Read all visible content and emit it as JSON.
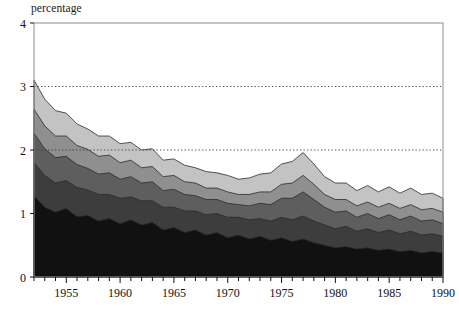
{
  "chart": {
    "type": "area",
    "ylabel_text": "percentage",
    "axis": {
      "y_ticks": [
        "0",
        "1",
        "2",
        "3",
        "4"
      ],
      "x_ticks": [
        "1955",
        "1960",
        "1965",
        "1970",
        "1975",
        "1980",
        "1985",
        "1990"
      ]
    }
  },
  "chart_data": {
    "type": "area",
    "stacked": true,
    "title": "",
    "xlabel": "",
    "ylabel": "percentage",
    "xlim": [
      1952,
      1990
    ],
    "ylim": [
      0,
      4
    ],
    "y_ticks": [
      0,
      1,
      2,
      3,
      4
    ],
    "x_ticks": [
      1955,
      1960,
      1965,
      1970,
      1975,
      1980,
      1985,
      1990
    ],
    "x_minor_tick_step": 1,
    "gridlines": {
      "y": [
        2,
        3
      ],
      "style": "dotted"
    },
    "legend": "none",
    "colors": [
      "#111111",
      "#3d3d3d",
      "#5e5e5e",
      "#8f8f8f",
      "#c3c3c3"
    ],
    "x": [
      1952,
      1953,
      1954,
      1955,
      1956,
      1957,
      1958,
      1959,
      1960,
      1961,
      1962,
      1963,
      1964,
      1965,
      1966,
      1967,
      1968,
      1969,
      1970,
      1971,
      1972,
      1973,
      1974,
      1975,
      1976,
      1977,
      1978,
      1979,
      1980,
      1981,
      1982,
      1983,
      1984,
      1985,
      1986,
      1987,
      1988,
      1989,
      1990
    ],
    "series": [
      {
        "name": "band-1-darkest",
        "values": [
          1.28,
          1.1,
          1.02,
          1.08,
          0.95,
          0.97,
          0.88,
          0.92,
          0.84,
          0.9,
          0.82,
          0.86,
          0.74,
          0.78,
          0.7,
          0.74,
          0.66,
          0.7,
          0.62,
          0.66,
          0.6,
          0.64,
          0.58,
          0.62,
          0.56,
          0.6,
          0.54,
          0.5,
          0.46,
          0.48,
          0.44,
          0.46,
          0.42,
          0.44,
          0.4,
          0.42,
          0.38,
          0.4,
          0.38
        ]
      },
      {
        "name": "band-2-dark",
        "values": [
          0.52,
          0.5,
          0.46,
          0.44,
          0.46,
          0.4,
          0.42,
          0.38,
          0.4,
          0.36,
          0.38,
          0.34,
          0.36,
          0.32,
          0.34,
          0.3,
          0.32,
          0.3,
          0.32,
          0.28,
          0.3,
          0.28,
          0.3,
          0.32,
          0.34,
          0.36,
          0.34,
          0.32,
          0.3,
          0.32,
          0.28,
          0.3,
          0.28,
          0.3,
          0.28,
          0.3,
          0.28,
          0.28,
          0.26
        ]
      },
      {
        "name": "band-3-mid",
        "values": [
          0.46,
          0.42,
          0.4,
          0.38,
          0.36,
          0.34,
          0.32,
          0.34,
          0.3,
          0.32,
          0.28,
          0.3,
          0.26,
          0.28,
          0.26,
          0.24,
          0.24,
          0.22,
          0.22,
          0.2,
          0.22,
          0.24,
          0.26,
          0.3,
          0.34,
          0.38,
          0.34,
          0.28,
          0.26,
          0.24,
          0.22,
          0.24,
          0.22,
          0.24,
          0.22,
          0.24,
          0.22,
          0.22,
          0.2
        ]
      },
      {
        "name": "band-4-light",
        "values": [
          0.38,
          0.36,
          0.34,
          0.32,
          0.3,
          0.3,
          0.28,
          0.28,
          0.26,
          0.26,
          0.24,
          0.24,
          0.22,
          0.22,
          0.2,
          0.2,
          0.18,
          0.18,
          0.18,
          0.16,
          0.18,
          0.18,
          0.2,
          0.22,
          0.24,
          0.26,
          0.24,
          0.2,
          0.2,
          0.18,
          0.18,
          0.18,
          0.18,
          0.18,
          0.18,
          0.18,
          0.18,
          0.18,
          0.18
        ]
      },
      {
        "name": "band-5-lightest",
        "values": [
          0.46,
          0.42,
          0.4,
          0.36,
          0.34,
          0.32,
          0.32,
          0.3,
          0.3,
          0.28,
          0.28,
          0.28,
          0.26,
          0.26,
          0.26,
          0.24,
          0.26,
          0.24,
          0.26,
          0.24,
          0.26,
          0.28,
          0.3,
          0.32,
          0.34,
          0.36,
          0.32,
          0.28,
          0.26,
          0.26,
          0.24,
          0.26,
          0.24,
          0.26,
          0.24,
          0.26,
          0.24,
          0.24,
          0.22
        ]
      }
    ],
    "totals": [
      3.1,
      2.8,
      2.62,
      2.58,
      2.41,
      2.33,
      2.22,
      2.22,
      2.1,
      2.12,
      2.0,
      2.02,
      1.84,
      1.86,
      1.76,
      1.72,
      1.66,
      1.64,
      1.6,
      1.54,
      1.56,
      1.62,
      1.64,
      1.78,
      1.82,
      1.96,
      1.78,
      1.58,
      1.48,
      1.48,
      1.36,
      1.44,
      1.34,
      1.42,
      1.32,
      1.4,
      1.3,
      1.32,
      1.24
    ]
  }
}
